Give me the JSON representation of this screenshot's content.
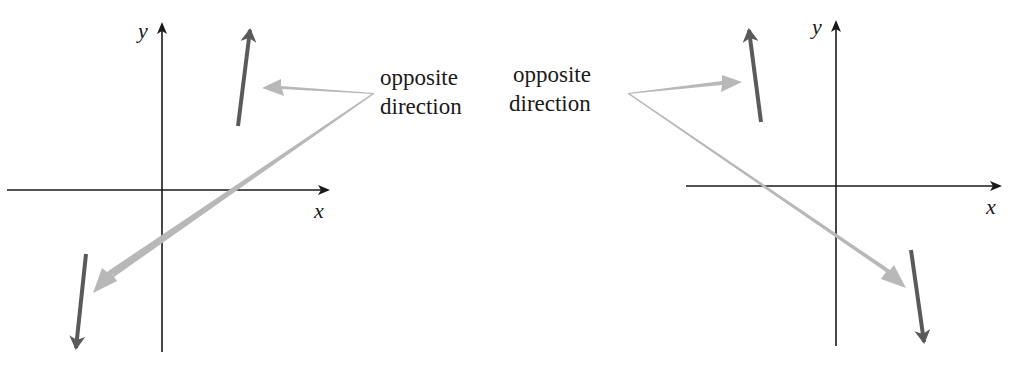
{
  "figure": {
    "colors": {
      "axis": "#1a1a1a",
      "vector": "#5a5a5a",
      "callout_arrow": "#b8b8b8",
      "text": "#1a1a1a",
      "background": "#ffffff"
    }
  },
  "left_panel": {
    "x_label": "x",
    "y_label": "y",
    "callout": {
      "line1": "opposite",
      "line2": "direction"
    },
    "vectors": [
      {
        "name": "up-vector",
        "from": [
          238,
          126
        ],
        "to": [
          250,
          28
        ]
      },
      {
        "name": "down-vector",
        "from": [
          86,
          254
        ],
        "to": [
          76,
          350
        ]
      }
    ]
  },
  "right_panel": {
    "x_label": "x",
    "y_label": "y",
    "callout": {
      "line1": "opposite",
      "line2": "direction"
    },
    "vectors": [
      {
        "name": "up-vector",
        "from": [
          761,
          122
        ],
        "to": [
          749,
          28
        ]
      },
      {
        "name": "down-vector",
        "from": [
          911,
          250
        ],
        "to": [
          925,
          344
        ]
      }
    ]
  }
}
